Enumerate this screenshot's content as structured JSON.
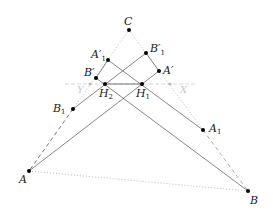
{
  "diagram": {
    "points": {
      "C": {
        "label": "C",
        "x": 129,
        "y": 30
      },
      "A1p": {
        "label": "A′",
        "sub": "1",
        "x": 108,
        "y": 60
      },
      "B1p": {
        "label": "B′",
        "sub": "1",
        "x": 146,
        "y": 53
      },
      "Ap": {
        "label": "A′",
        "x": 159,
        "y": 71
      },
      "Bp": {
        "label": "B′",
        "x": 96,
        "y": 78
      },
      "H2": {
        "label": "H",
        "sub": "2",
        "x": 105,
        "y": 84
      },
      "H1": {
        "label": "H",
        "sub": "1",
        "x": 142,
        "y": 84
      },
      "B1": {
        "label": "B",
        "sub": "1",
        "x": 73,
        "y": 109
      },
      "A1": {
        "label": "A",
        "sub": "1",
        "x": 203,
        "y": 130
      },
      "A": {
        "label": "A",
        "x": 29,
        "y": 171
      },
      "B": {
        "label": "B",
        "x": 248,
        "y": 191
      }
    },
    "line_labels": {
      "left": "Y",
      "right": "X"
    },
    "colors": {
      "line": "#555555",
      "dotted": "#aaaaaa",
      "point": "#000000",
      "gray_line": "#cccccc"
    }
  }
}
